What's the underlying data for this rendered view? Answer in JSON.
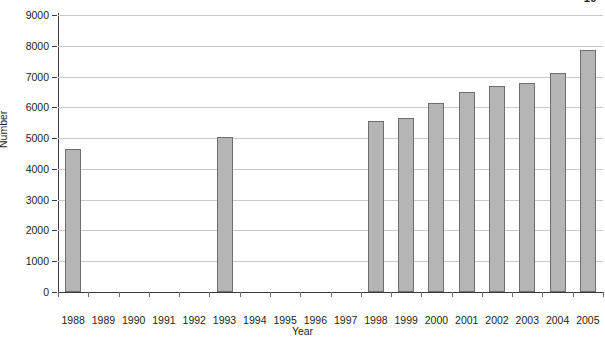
{
  "page": {
    "header_fragment": "10"
  },
  "chart_data": {
    "type": "bar",
    "title": "",
    "xlabel": "Year",
    "ylabel": "Number",
    "categories": [
      "1988",
      "1989",
      "1990",
      "1991",
      "1992",
      "1993",
      "1994",
      "1995",
      "1996",
      "1997",
      "1998",
      "1999",
      "2000",
      "2001",
      "2002",
      "2003",
      "2004",
      "2005"
    ],
    "values": [
      4650,
      null,
      null,
      null,
      null,
      5030,
      null,
      null,
      null,
      null,
      5550,
      5640,
      6140,
      6490,
      6680,
      6790,
      7110,
      7870
    ],
    "ylim": [
      0,
      9000
    ],
    "ytick_labels": [
      "0",
      "1000",
      "2000",
      "3000",
      "4000",
      "5000",
      "6000",
      "7000",
      "8000",
      "9000"
    ],
    "ytick_values": [
      0,
      1000,
      2000,
      3000,
      4000,
      5000,
      6000,
      7000,
      8000,
      9000
    ],
    "grid": true,
    "legend": null,
    "bar_color": "#b5b5b5",
    "bar_edge_color": "#6e6e6e",
    "grid_color": "#c9c9c9",
    "axis_color": "#3a3a3a"
  }
}
